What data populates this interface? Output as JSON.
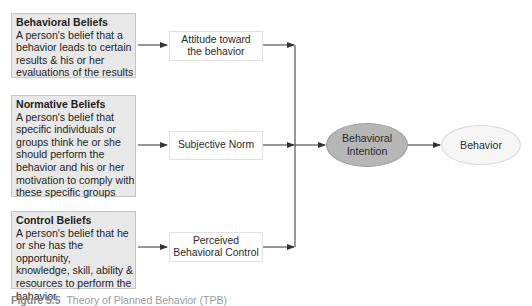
{
  "beliefs": [
    {
      "title": "Behavioral Beliefs",
      "lines": [
        "A person's belief that a",
        "behavior leads to certain",
        "results & his or her",
        "evaluations of the results"
      ]
    },
    {
      "title": "Normative Beliefs",
      "lines": [
        "A person's belief that",
        "specific individuals or",
        "groups think he or she",
        "should perform the",
        "behavior and his or her",
        "motivation to comply with",
        "these specific groups"
      ]
    },
    {
      "title": "Control Beliefs",
      "lines": [
        "A person's belief that he",
        "or she has the opportunity,",
        "knowledge, skill, ability &",
        "resources to perform the",
        "bahavior"
      ]
    }
  ],
  "constructs": [
    {
      "lines": [
        "Attitude toward",
        "the behavior"
      ]
    },
    {
      "lines": [
        "Subjective Norm"
      ]
    },
    {
      "lines": [
        "Perceived",
        "Behavioral Control"
      ]
    }
  ],
  "intention": {
    "lines": [
      "Behavioral",
      "Intention"
    ]
  },
  "behavior": {
    "label": "Behavior"
  },
  "caption": {
    "figure": "Figure 5.5",
    "text": "Theory of Planned Behavior (TPB)"
  },
  "colors": {
    "belief_fill": "#e8e8e8",
    "intention_fill": "#b6b6b6",
    "behavior_fill": "#f6f6f6",
    "line": "#333333"
  }
}
